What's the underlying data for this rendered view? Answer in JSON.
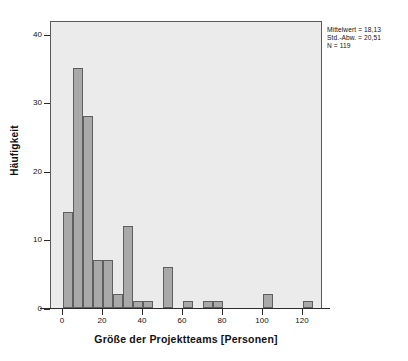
{
  "chart_data": {
    "type": "bar",
    "title": "",
    "subtitle": "",
    "xlabel": "Größe der Projektteams [Personen]",
    "ylabel": "Häufigkeit",
    "grid": false,
    "legend": null,
    "legend_position": "none",
    "bin_width": 5,
    "xlim": [
      -6,
      130
    ],
    "ylim": [
      0,
      42
    ],
    "x_ticks": [
      0,
      20,
      40,
      60,
      80,
      100,
      120
    ],
    "x_tick_labels": [
      "0",
      "20",
      "40",
      "60",
      "80",
      "100",
      "120"
    ],
    "y_ticks": [
      0,
      10,
      20,
      30,
      40
    ],
    "y_tick_labels": [
      "0",
      "10",
      "20",
      "30",
      "40"
    ],
    "categories": [
      "0–5",
      "5–10",
      "10–15",
      "15–20",
      "20–25",
      "25–30",
      "30–35",
      "35–40",
      "40–45",
      "50–55",
      "60–65",
      "70–75",
      "75–80",
      "100–105",
      "120–125"
    ],
    "bins": [
      {
        "start": 0,
        "end": 5,
        "value": 14
      },
      {
        "start": 5,
        "end": 10,
        "value": 35
      },
      {
        "start": 10,
        "end": 15,
        "value": 28
      },
      {
        "start": 15,
        "end": 20,
        "value": 7
      },
      {
        "start": 20,
        "end": 25,
        "value": 7
      },
      {
        "start": 25,
        "end": 30,
        "value": 2
      },
      {
        "start": 30,
        "end": 35,
        "value": 12
      },
      {
        "start": 35,
        "end": 40,
        "value": 1
      },
      {
        "start": 40,
        "end": 45,
        "value": 1
      },
      {
        "start": 50,
        "end": 55,
        "value": 6
      },
      {
        "start": 60,
        "end": 65,
        "value": 1
      },
      {
        "start": 70,
        "end": 75,
        "value": 1
      },
      {
        "start": 75,
        "end": 80,
        "value": 1
      },
      {
        "start": 100,
        "end": 105,
        "value": 2
      },
      {
        "start": 120,
        "end": 125,
        "value": 1
      }
    ],
    "values": [
      14,
      35,
      28,
      7,
      7,
      2,
      12,
      1,
      1,
      6,
      1,
      1,
      1,
      2,
      1
    ],
    "annotations": [
      "Mittelwert = 18,13",
      "Std.-Abw. = 20,51",
      "N = 119"
    ],
    "colors": {
      "bar_fill": "#a9a9a9",
      "bar_edge": "#5f5f5f",
      "plot_background": "#ebebeb",
      "plot_border": "#5a5a5a",
      "axis": "#2b2b2b",
      "text": "#111111",
      "page_background": "#ffffff"
    }
  },
  "stats": {
    "mean_line": "Mittelwert = 18,13",
    "std_line": "Std.-Abw. = 20,51",
    "n_line": "N = 119"
  },
  "axes": {
    "x_title": "Größe der Projektteams [Personen]",
    "y_title": "Häufigkeit"
  }
}
